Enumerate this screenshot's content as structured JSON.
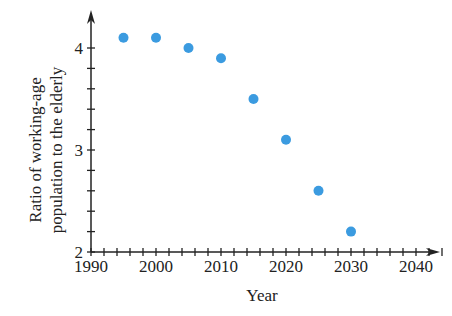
{
  "chart_data": {
    "type": "scatter",
    "title": "",
    "xlabel": "Year",
    "ylabel": "Ratio of working-age population to the elderly",
    "ylabel_lines": [
      "Ratio of working-age",
      "population to the elderly"
    ],
    "x": [
      1995,
      2000,
      2005,
      2010,
      2015,
      2020,
      2025,
      2030
    ],
    "y": [
      4.1,
      4.1,
      4.0,
      3.9,
      3.5,
      3.1,
      2.6,
      2.2
    ],
    "xlim": [
      1990,
      2040
    ],
    "ylim": [
      2,
      4
    ],
    "x_ticks": [
      1990,
      2000,
      2010,
      2020,
      2030,
      2040
    ],
    "x_tick_labels": [
      "1990",
      "2000",
      "2010",
      "2020",
      "2030",
      "2040"
    ],
    "x_minor_step": 2,
    "y_ticks": [
      2,
      3,
      4
    ],
    "y_tick_labels": [
      "2",
      "3",
      "4"
    ],
    "y_minor_step": 0.2,
    "grid": false,
    "legend": null,
    "marker_color": "#3b9be0",
    "axis_color": "#222222"
  }
}
